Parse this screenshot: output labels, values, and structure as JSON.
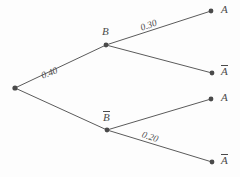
{
  "diagram": {
    "type": "probability-tree",
    "title": "",
    "background_color": "#fdfdfd",
    "line_color": "#5b5b5b",
    "node_color": "#4a4a4a",
    "root": {
      "name": "root-node",
      "x": 15,
      "y": 88
    },
    "nodes": [
      {
        "id": "B",
        "label": "B",
        "overline": false,
        "x": 106,
        "y": 45,
        "label_x": 102,
        "label_y": 26
      },
      {
        "id": "Bbar",
        "label": "B",
        "overline": true,
        "x": 107,
        "y": 130,
        "label_x": 103,
        "label_y": 111
      },
      {
        "id": "A_top",
        "label": "A",
        "overline": false,
        "x": 211,
        "y": 11,
        "label_x": 221,
        "label_y": 4
      },
      {
        "id": "Abar_top",
        "label": "A",
        "overline": true,
        "x": 212,
        "y": 73,
        "label_x": 221,
        "label_y": 65
      },
      {
        "id": "A_bot",
        "label": "A",
        "overline": false,
        "x": 211,
        "y": 99,
        "label_x": 221,
        "label_y": 92
      },
      {
        "id": "Abar_bot",
        "label": "A",
        "overline": true,
        "x": 212,
        "y": 162,
        "label_x": 221,
        "label_y": 154
      }
    ],
    "edges": [
      {
        "id": "root-to-B",
        "from": "root",
        "to": "B",
        "label": "0.40",
        "label_x": 42,
        "label_y": 72,
        "rotation": -22
      },
      {
        "id": "root-to-Bbar",
        "from": "root",
        "to": "Bbar",
        "label": "",
        "label_x": 0,
        "label_y": 0,
        "rotation": 0
      },
      {
        "id": "B-to-A",
        "from": "B",
        "to": "A_top",
        "label": "0.30",
        "label_x": 141,
        "label_y": 24,
        "rotation": -20
      },
      {
        "id": "B-to-Abar",
        "from": "B",
        "to": "Abar_top",
        "label": "",
        "label_x": 0,
        "label_y": 0,
        "rotation": 0
      },
      {
        "id": "Bbar-to-A",
        "from": "Bbar",
        "to": "A_bot",
        "label": "",
        "label_x": 0,
        "label_y": 0,
        "rotation": 0
      },
      {
        "id": "Bbar-to-Abar",
        "from": "Bbar",
        "to": "Abar_bot",
        "label": "0.20",
        "label_x": 142,
        "label_y": 130,
        "rotation": 19
      }
    ],
    "probabilities": {
      "p_B": "0.40",
      "p_A_given_B": "0.30",
      "p_Abar_given_Bbar": "0.20"
    }
  }
}
